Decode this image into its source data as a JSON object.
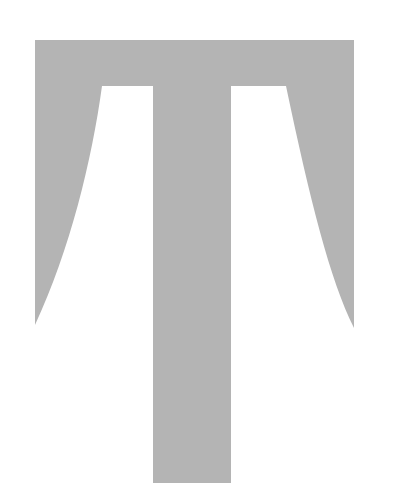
{
  "glyph": {
    "character": "T",
    "fill_color": "#b4b4b4",
    "background_color": "#ffffff",
    "description": "Large stylized serif letter T in light gray"
  }
}
